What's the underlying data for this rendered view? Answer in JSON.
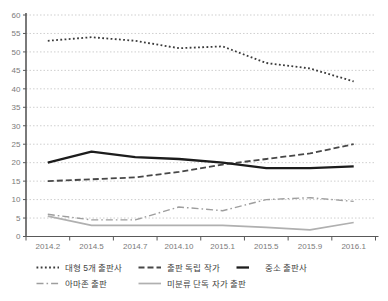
{
  "chart_data": {
    "type": "line",
    "title": "",
    "categories": [
      "2014.2",
      "2014.5",
      "2014.7",
      "2014.10",
      "2015.1",
      "2015.5",
      "2015.9",
      "2016.1"
    ],
    "y_axis": {
      "min": 0,
      "max": 60,
      "step": 5,
      "tick_labels": [
        "0",
        "5",
        "10",
        "15",
        "20",
        "25",
        "30",
        "35",
        "40",
        "45",
        "50",
        "55",
        "60"
      ]
    },
    "grid": "horizontal-dotted",
    "legend_position": "bottom-left",
    "series": [
      {
        "name": "대형 5개 출판사",
        "line_style": "dotted",
        "color": "#3a3a3a",
        "width": 1.8,
        "values": [
          53,
          54,
          53,
          51,
          51.5,
          47,
          45.5,
          42
        ]
      },
      {
        "name": "출판 독립 작가",
        "line_style": "dashed",
        "color": "#474747",
        "width": 1.8,
        "values": [
          15,
          15.5,
          16,
          17.5,
          19.5,
          21,
          22.5,
          25
        ]
      },
      {
        "name": "중소 출판사",
        "line_style": "solid",
        "color": "#1c1c1c",
        "width": 2.3,
        "values": [
          20,
          23,
          21.5,
          21,
          20,
          18.5,
          18.5,
          19
        ]
      },
      {
        "name": "아마존 출판",
        "line_style": "dash-dot",
        "color": "#9e9e9e",
        "width": 1.4,
        "values": [
          6,
          4.5,
          4.5,
          8,
          7,
          10,
          10.5,
          9.5
        ]
      },
      {
        "name": "미분류 단독 자가 출판",
        "line_style": "solid",
        "color": "#b0b0b0",
        "width": 1.7,
        "values": [
          5.5,
          3,
          3,
          3,
          3,
          2.5,
          1.8,
          3.8
        ]
      }
    ],
    "colors": {
      "gridline": "#cfcfcf",
      "axis": "#595959",
      "tick_text": "#7a7a7a"
    }
  }
}
